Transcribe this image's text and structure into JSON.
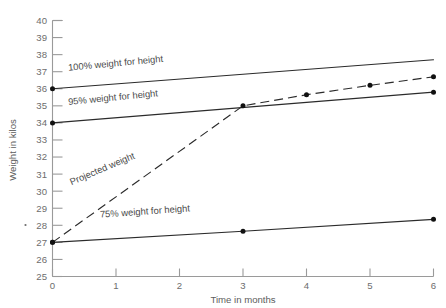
{
  "chart_data": {
    "type": "line",
    "title": "",
    "xlabel": "Time in months",
    "ylabel": "Weight in kilos",
    "xlim": [
      0,
      6
    ],
    "ylim": [
      25,
      40
    ],
    "x_ticks": [
      "0",
      "1",
      "2",
      "3",
      "4",
      "5",
      "6"
    ],
    "y_ticks": [
      "25",
      "26",
      "27",
      "28",
      "29",
      "30",
      "31",
      "32",
      "33",
      "34",
      "35",
      "36",
      "37",
      "38",
      "39",
      "40"
    ],
    "grid": false,
    "legend_position": "inline-annotations",
    "series": [
      {
        "name": "100% weight for height",
        "label": "100% weight for height",
        "style": "solid",
        "x": [
          0,
          6
        ],
        "values": [
          36.0,
          37.7
        ],
        "markers_at": [
          0
        ]
      },
      {
        "name": "95% weight for height",
        "label": "95% weight for height",
        "style": "solid",
        "x": [
          0,
          6
        ],
        "values": [
          34.0,
          35.8
        ],
        "markers_at": [
          0,
          3,
          6
        ]
      },
      {
        "name": "Projected weight",
        "label": "Projected weight",
        "style": "dashed",
        "x": [
          0,
          3,
          4,
          5,
          6
        ],
        "values": [
          27.0,
          35.0,
          35.65,
          36.2,
          36.7
        ],
        "markers_at": [
          0,
          3,
          4,
          5,
          6
        ]
      },
      {
        "name": "75% weight for height",
        "label": "75% weight for height",
        "style": "solid",
        "x": [
          0,
          3,
          6
        ],
        "values": [
          27.0,
          27.65,
          28.35
        ],
        "markers_at": [
          0,
          3,
          6
        ]
      }
    ],
    "annotations": [
      {
        "text": "100% weight for height",
        "x": 0.25,
        "y": 37.05,
        "rotation": -5.5
      },
      {
        "text": "95% weight for height",
        "x": 0.25,
        "y": 35.05,
        "rotation": -5.5
      },
      {
        "text": "Projected weight",
        "x": 0.3,
        "y": 30.35,
        "rotation": -23
      },
      {
        "text": "75% weight for height",
        "x": 0.75,
        "y": 28.45,
        "rotation": -4
      }
    ]
  }
}
